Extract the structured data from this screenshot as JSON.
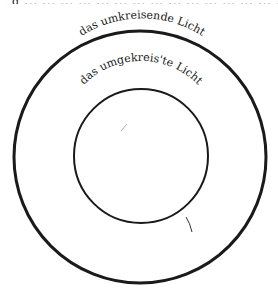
{
  "diagram": {
    "type": "concentric-circles",
    "top_cut_text": "g ... ... ... ... ... ... ... ... ... ... ... ... ... ... ... ... ...",
    "outer_circle": {
      "label": "das umkreisende Licht",
      "cx": 140,
      "cy": 157,
      "r": 126,
      "stroke": "#1a1a1a",
      "stroke_width": 3
    },
    "inner_circle": {
      "label": "das umgekreis'te Licht",
      "cx": 141,
      "cy": 156,
      "r": 67,
      "stroke": "#1a1a1a",
      "stroke_width": 2
    }
  }
}
